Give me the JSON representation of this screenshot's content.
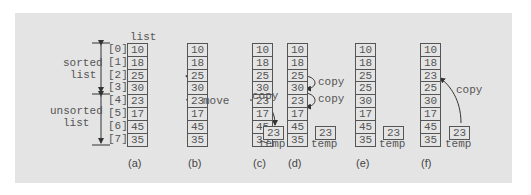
{
  "list_header": "list",
  "indices": [
    "[0]",
    "[1]",
    "[2]",
    "[3]",
    "[4]",
    "[5]",
    "[6]",
    "[7]"
  ],
  "sorted_label": [
    "sorted",
    "list"
  ],
  "unsorted_label": [
    "unsorted",
    "list"
  ],
  "columns": [
    {
      "caption": "(a)",
      "values": [
        "10",
        "18",
        "25",
        "30",
        "23",
        "17",
        "45",
        "35"
      ]
    },
    {
      "caption": "(b)",
      "values": [
        "10",
        "18",
        "25",
        "30",
        "23",
        "17",
        "45",
        "35"
      ],
      "annotation": "move"
    },
    {
      "caption": "(c)",
      "values": [
        "10",
        "18",
        "25",
        "30",
        "23",
        "17",
        "45",
        "35"
      ],
      "annotation": "copy",
      "temp": "23",
      "temp_label": "temp"
    },
    {
      "caption": "(d)",
      "values": [
        "10",
        "18",
        "25",
        "30",
        "23",
        "17",
        "45",
        "35"
      ],
      "annotations": [
        "copy",
        "copy"
      ],
      "temp": "23",
      "temp_label": "temp"
    },
    {
      "caption": "(e)",
      "values": [
        "10",
        "18",
        "25",
        "25",
        "30",
        "17",
        "45",
        "35"
      ],
      "temp": "23",
      "temp_label": "temp"
    },
    {
      "caption": "(f)",
      "values": [
        "10",
        "18",
        "23",
        "25",
        "30",
        "17",
        "45",
        "35"
      ],
      "annotation": "copy",
      "temp": "23",
      "temp_label": "temp"
    }
  ],
  "colors": {
    "panel": "#e4e4e4",
    "stroke": "#555555"
  }
}
